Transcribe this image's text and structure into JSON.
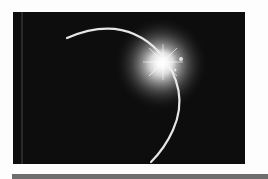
{
  "image": {
    "subject": "solar eclipse diamond ring over dark planet limb",
    "background_color": "#0d0d0d",
    "limb_color": "#e8e8e8",
    "flare_color": "#ffffff"
  },
  "bottom_bar": {
    "color": "#6e6e6e"
  }
}
